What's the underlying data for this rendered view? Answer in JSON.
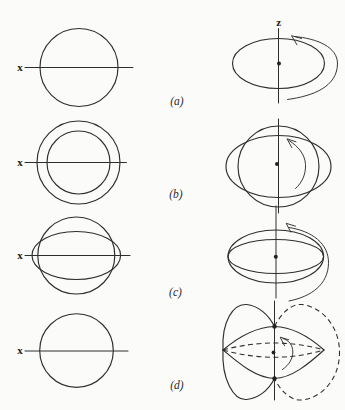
{
  "figure": {
    "background_color": "#fbfbf9",
    "line_color": "#2e2e2c",
    "z_axis_label": "z",
    "panels": [
      {
        "caption": "(a)",
        "x_label": "x"
      },
      {
        "caption": "(b)",
        "x_label": "x"
      },
      {
        "caption": "(c)",
        "x_label": "x"
      },
      {
        "caption": "(d)",
        "x_label": "x"
      }
    ]
  }
}
